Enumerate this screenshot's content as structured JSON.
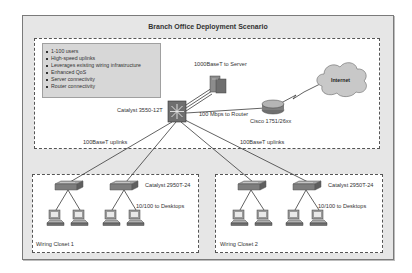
{
  "diagram": {
    "title": "Branch Office Deployment Scenario",
    "features": [
      "1-100 users",
      "High-speed uplinks",
      "Leverages existing wiring infrastructure",
      "Enhanced QoS",
      "Server connectivity",
      "Router connectivity"
    ],
    "core_switch": {
      "label": "Catalyst 3550-12T"
    },
    "server_link": {
      "label": "1000BaseT to Server"
    },
    "router_link": {
      "label": "100 Mbps to Router"
    },
    "router": {
      "label": "Cisco 1751/26xx"
    },
    "internet": {
      "label": "Internet"
    },
    "uplinks_left": {
      "label": "100BaseT uplinks"
    },
    "uplinks_right": {
      "label": "100BaseT uplinks"
    },
    "closets": [
      {
        "label": "Wiring Closet 1",
        "switch_label": "Catalyst 2950T-24",
        "desktop_link": "10/100 to Desktops"
      },
      {
        "label": "Wiring Closet 2",
        "switch_label": "Catalyst 2950T-24",
        "desktop_link": "10/100 to Desktops"
      }
    ],
    "colors": {
      "frame_bg": "#e6e6e6",
      "switch": "#7e7e7e",
      "core_switch": "#6f6f6f",
      "cloud": "#c8c8c8",
      "line": "#3a3a3a"
    }
  }
}
